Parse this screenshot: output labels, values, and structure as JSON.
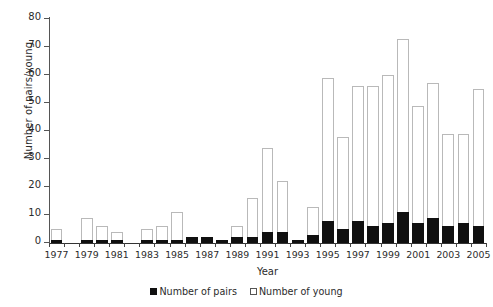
{
  "chart_data": {
    "type": "bar",
    "title": "",
    "xlabel": "Year",
    "ylabel": "Number of pairs/young",
    "stacked": false,
    "overlaid": true,
    "grid": false,
    "legend_position": "bottom-center",
    "ylim": [
      0,
      80
    ],
    "yticks": [
      0,
      10,
      20,
      30,
      40,
      50,
      60,
      70,
      80
    ],
    "ytick_labels": [
      "0",
      "10",
      "20",
      "30",
      "40",
      "50",
      "60",
      "70",
      "80"
    ],
    "categories": [
      "1977",
      "1978",
      "1979",
      "1980",
      "1981",
      "1982",
      "1983",
      "1984",
      "1985",
      "1986",
      "1987",
      "1988",
      "1989",
      "1990",
      "1991",
      "1992",
      "1993",
      "1994",
      "1995",
      "1996",
      "1997",
      "1998",
      "1999",
      "2000",
      "2001",
      "2002",
      "2003",
      "2004",
      "2005"
    ],
    "xtick_labels": [
      "1977",
      "1979",
      "1981",
      "1983",
      "1985",
      "1987",
      "1989",
      "1991",
      "1993",
      "1995",
      "1997",
      "1999",
      "2001",
      "2003",
      "2005"
    ],
    "series": [
      {
        "name": "Number of young",
        "key": "young",
        "color": "#ffffff",
        "edge_color": "#b9b9b9",
        "values": [
          5,
          0,
          9,
          6,
          4,
          0,
          5,
          6,
          11,
          2,
          2,
          1,
          6,
          16,
          34,
          22,
          1,
          13,
          59,
          38,
          56,
          56,
          60,
          73,
          49,
          57,
          39,
          39,
          55
        ]
      },
      {
        "name": "Number of pairs",
        "key": "pairs",
        "color": "#101010",
        "edge_color": "#101010",
        "values": [
          1,
          0,
          1,
          1,
          1,
          0,
          1,
          1,
          1,
          2,
          2,
          1,
          2,
          2,
          4,
          4,
          1,
          3,
          8,
          5,
          8,
          6,
          7,
          11,
          7,
          9,
          6,
          7,
          6
        ]
      }
    ]
  },
  "legend": {
    "items": [
      {
        "label": "Number of pairs",
        "style": "filled"
      },
      {
        "label": "Number of young",
        "style": "hollow"
      }
    ]
  }
}
